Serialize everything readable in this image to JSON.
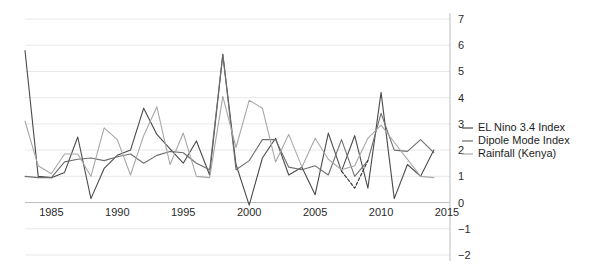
{
  "chart_data": {
    "type": "line",
    "title": "",
    "subtitle": "",
    "xlabel": "",
    "ylabel": "",
    "xlim": [
      1983,
      2015
    ],
    "ylim": [
      -2,
      7
    ],
    "xticks": [
      1985,
      1990,
      1995,
      2000,
      2005,
      2010,
      2015
    ],
    "yticks": [
      -2,
      -1,
      0,
      1,
      2,
      3,
      4,
      5,
      6,
      7
    ],
    "grid": true,
    "legend_position": "right",
    "x": [
      1983,
      1984,
      1985,
      1986,
      1987,
      1988,
      1989,
      1990,
      1991,
      1992,
      1993,
      1994,
      1995,
      1996,
      1997,
      1998,
      1999,
      2000,
      2001,
      2002,
      2003,
      2004,
      2005,
      2006,
      2007,
      2008,
      2009,
      2010,
      2011,
      2012,
      2013,
      2014
    ],
    "series": [
      {
        "name": "EL Nino 3.4 Index",
        "color": "#4a4a4a",
        "values": [
          5.8,
          1.0,
          0.95,
          1.15,
          2.5,
          0.15,
          1.3,
          1.8,
          2.0,
          3.6,
          2.6,
          2.05,
          1.5,
          2.35,
          1.05,
          5.65,
          1.45,
          -0.1,
          1.7,
          2.45,
          1.05,
          1.35,
          0.3,
          2.65,
          1.2,
          2.55,
          0.55,
          4.2,
          0.15,
          1.45,
          1.0,
          2.0
        ]
      },
      {
        "name": "Dipole Mode Index",
        "color": "#6e6e6e",
        "values": [
          1.0,
          0.95,
          0.95,
          1.55,
          1.65,
          1.7,
          1.6,
          1.75,
          1.85,
          1.5,
          1.8,
          1.95,
          1.9,
          1.5,
          1.25,
          5.65,
          1.25,
          1.6,
          2.4,
          2.4,
          1.35,
          1.25,
          1.4,
          1.05,
          2.4,
          1.0,
          1.6,
          3.4,
          2.0,
          1.95,
          2.4,
          1.9
        ]
      },
      {
        "name": "Rainfall (Kenya)",
        "color": "#a8a8a8",
        "values": [
          3.1,
          1.4,
          1.1,
          1.85,
          1.85,
          1.0,
          2.85,
          2.4,
          1.05,
          2.55,
          3.65,
          1.45,
          2.65,
          1.0,
          0.95,
          4.05,
          2.1,
          3.9,
          3.6,
          1.55,
          2.6,
          1.35,
          2.45,
          1.65,
          1.25,
          1.4,
          2.45,
          2.95,
          2.3,
          1.65,
          1.0,
          0.95
        ]
      }
    ],
    "annotations": [
      {
        "type": "dashed-segment",
        "series": "EL Nino 3.4 Index",
        "x": [
          2007,
          2008,
          2009
        ],
        "values": [
          1.2,
          0.55,
          1.6
        ],
        "color": "#3a3a3a"
      }
    ],
    "legend": [
      {
        "label": "EL Nino 3.4 Index",
        "color": "#4a4a4a"
      },
      {
        "label": "Dipole Mode Index",
        "color": "#6e6e6e"
      },
      {
        "label": "Rainfall (Kenya)",
        "color": "#a8a8a8"
      }
    ]
  },
  "axes": {
    "x_tick_labels": [
      "1985",
      "1990",
      "1995",
      "2000",
      "2005",
      "2010",
      "2015"
    ],
    "y_tick_labels": [
      "7",
      "6",
      "5",
      "4",
      "3",
      "2",
      "1",
      "0",
      "−1",
      "−2"
    ]
  }
}
